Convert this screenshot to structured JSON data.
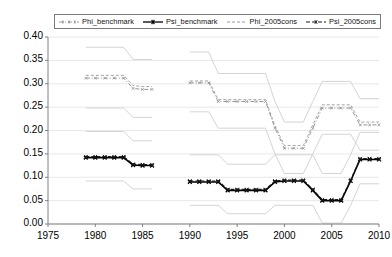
{
  "chart": {
    "type": "line",
    "title": "",
    "xlabel": "",
    "ylabel": "",
    "xlim": [
      1975,
      2010
    ],
    "ylim": [
      0.0,
      0.4
    ],
    "grid": true,
    "grid_axis": "y",
    "legend_position": "top-center",
    "background": "#ffffff",
    "axis_color": "#808080",
    "gridline_color": "#e8e8e8",
    "note": "Two disjoint estimation windows: 1979-1986 and 1990-2010. Dark series are point estimates with marker dashes; pale grey lines are the corresponding upper/lower confidence bands."
  },
  "yticks": [
    "0.40",
    "0.35",
    "0.30",
    "0.25",
    "0.20",
    "0.15",
    "0.10",
    "0.05",
    "0.00"
  ],
  "ytick_values": [
    0.4,
    0.35,
    0.3,
    0.25,
    0.2,
    0.15,
    0.1,
    0.05,
    0.0
  ],
  "xticks": [
    "1975",
    "1980",
    "1985",
    "1990",
    "1995",
    "2000",
    "2005",
    "2010"
  ],
  "xtick_values": [
    1975,
    1980,
    1985,
    1990,
    1995,
    2000,
    2005,
    2010
  ],
  "legend": {
    "items": [
      {
        "label": "Phi_benchmark",
        "color": "#8a8a8a",
        "style": "dash-dot-marker",
        "marker": "x"
      },
      {
        "label": "Psi_benchmark",
        "color": "#000000",
        "style": "solid-marker",
        "marker": "x"
      },
      {
        "label": "Phi_2005cons",
        "color": "#9a9a9a",
        "style": "dashed",
        "marker": "none"
      },
      {
        "label": "Psi_2005cons",
        "color": "#1a1a1a",
        "style": "dashed-marker",
        "marker": "x"
      }
    ]
  },
  "chart_data": {
    "type": "line",
    "title": "",
    "xlabel": "",
    "ylabel": "",
    "xlim": [
      1975,
      2010
    ],
    "ylim": [
      0.0,
      0.4
    ],
    "grid": true,
    "legend_position": "top",
    "categories": [
      1979,
      1980,
      1981,
      1982,
      1983,
      1984,
      1985,
      1986,
      1990,
      1991,
      1992,
      1993,
      1994,
      1995,
      1996,
      1997,
      1998,
      1999,
      2000,
      2001,
      2002,
      2003,
      2004,
      2005,
      2006,
      2007,
      2008,
      2009,
      2010
    ],
    "series": [
      {
        "name": "Phi_benchmark",
        "color": "#8a8a8a",
        "x": [
          1979,
          1980,
          1981,
          1982,
          1983,
          1984,
          1985,
          1986
        ],
        "values": [
          0.312,
          0.312,
          0.312,
          0.312,
          0.312,
          0.29,
          0.288,
          0.288
        ],
        "x2": [
          1990,
          1991,
          1992,
          1993,
          1994,
          1995,
          1996,
          1997,
          1998,
          1999,
          2000,
          2001,
          2002,
          2003,
          2004,
          2005,
          2006,
          2007,
          2008,
          2009,
          2010
        ],
        "values2": [
          0.302,
          0.302,
          0.302,
          0.262,
          0.262,
          0.262,
          0.262,
          0.262,
          0.262,
          0.205,
          0.162,
          0.162,
          0.162,
          0.205,
          0.248,
          0.248,
          0.248,
          0.248,
          0.212,
          0.212,
          0.212
        ]
      },
      {
        "name": "Psi_benchmark",
        "color": "#000000",
        "x": [
          1979,
          1980,
          1981,
          1982,
          1983,
          1984,
          1985,
          1986
        ],
        "values": [
          0.142,
          0.142,
          0.142,
          0.142,
          0.142,
          0.126,
          0.125,
          0.125
        ],
        "x2": [
          1990,
          1991,
          1992,
          1993,
          1994,
          1995,
          1996,
          1997,
          1998,
          1999,
          2000,
          2001,
          2002,
          2003,
          2004,
          2005,
          2006,
          2007,
          2008,
          2009,
          2010
        ],
        "values2": [
          0.09,
          0.09,
          0.09,
          0.09,
          0.072,
          0.072,
          0.072,
          0.072,
          0.072,
          0.09,
          0.092,
          0.092,
          0.092,
          0.072,
          0.05,
          0.05,
          0.05,
          0.092,
          0.138,
          0.138,
          0.138
        ]
      },
      {
        "name": "Phi_2005cons",
        "color": "#9a9a9a",
        "x": [
          1979,
          1980,
          1981,
          1982,
          1983,
          1984,
          1985,
          1986
        ],
        "values": [
          0.318,
          0.318,
          0.318,
          0.318,
          0.318,
          0.296,
          0.294,
          0.294
        ],
        "x2": [
          1990,
          1991,
          1992,
          1993,
          1994,
          1995,
          1996,
          1997,
          1998,
          1999,
          2000,
          2001,
          2002,
          2003,
          2004,
          2005,
          2006,
          2007,
          2008,
          2009,
          2010
        ],
        "values2": [
          0.306,
          0.306,
          0.306,
          0.266,
          0.266,
          0.266,
          0.266,
          0.266,
          0.266,
          0.21,
          0.168,
          0.168,
          0.168,
          0.212,
          0.255,
          0.255,
          0.255,
          0.255,
          0.218,
          0.218,
          0.218
        ]
      },
      {
        "name": "Psi_2005cons",
        "color": "#1a1a1a",
        "x": [
          1979,
          1980,
          1981,
          1982,
          1983,
          1984,
          1985,
          1986
        ],
        "values": [
          0.144,
          0.144,
          0.144,
          0.144,
          0.144,
          0.128,
          0.127,
          0.127
        ],
        "x2": [
          1990,
          1991,
          1992,
          1993,
          1994,
          1995,
          1996,
          1997,
          1998,
          1999,
          2000,
          2001,
          2002,
          2003,
          2004,
          2005,
          2006,
          2007,
          2008,
          2009,
          2010
        ],
        "values2": [
          0.092,
          0.092,
          0.092,
          0.092,
          0.074,
          0.074,
          0.074,
          0.074,
          0.074,
          0.092,
          0.094,
          0.094,
          0.094,
          0.074,
          0.052,
          0.052,
          0.052,
          0.094,
          0.14,
          0.14,
          0.14
        ]
      }
    ],
    "confidence_bands": [
      {
        "name": "Phi_upper",
        "color": "#d4d4d4",
        "x": [
          1979,
          1983,
          1984,
          1986
        ],
        "values": [
          0.378,
          0.378,
          0.352,
          0.352
        ],
        "x2": [
          1990,
          1992,
          1993,
          1998,
          1999,
          2000,
          2002,
          2003,
          2004,
          2007,
          2008,
          2010
        ],
        "values2": [
          0.368,
          0.368,
          0.322,
          0.322,
          0.262,
          0.218,
          0.218,
          0.262,
          0.305,
          0.305,
          0.268,
          0.268
        ]
      },
      {
        "name": "Phi_lower",
        "color": "#d4d4d4",
        "x": [
          1979,
          1983,
          1984,
          1986
        ],
        "values": [
          0.248,
          0.248,
          0.228,
          0.228
        ],
        "x2": [
          1990,
          1992,
          1993,
          1998,
          1999,
          2000,
          2002,
          2003,
          2004,
          2007,
          2008,
          2010
        ],
        "values2": [
          0.24,
          0.24,
          0.205,
          0.205,
          0.15,
          0.108,
          0.108,
          0.15,
          0.192,
          0.192,
          0.158,
          0.158
        ]
      },
      {
        "name": "Psi_upper",
        "color": "#d4d4d4",
        "x": [
          1979,
          1983,
          1984,
          1986
        ],
        "values": [
          0.198,
          0.198,
          0.178,
          0.178
        ],
        "x2": [
          1990,
          1993,
          1994,
          1998,
          1999,
          2003,
          2004,
          2006,
          2007,
          2008,
          2010
        ],
        "values2": [
          0.148,
          0.148,
          0.128,
          0.128,
          0.148,
          0.148,
          0.108,
          0.108,
          0.148,
          0.196,
          0.196
        ]
      },
      {
        "name": "Psi_lower",
        "color": "#d4d4d4",
        "x": [
          1979,
          1983,
          1984,
          1986
        ],
        "values": [
          0.092,
          0.092,
          0.075,
          0.075
        ],
        "x2": [
          1990,
          1993,
          1994,
          1998,
          1999,
          2003,
          2004,
          2006,
          2007,
          2008,
          2010
        ],
        "values2": [
          0.04,
          0.04,
          0.022,
          0.022,
          0.04,
          0.04,
          0.002,
          0.002,
          0.04,
          0.086,
          0.086
        ]
      }
    ]
  }
}
